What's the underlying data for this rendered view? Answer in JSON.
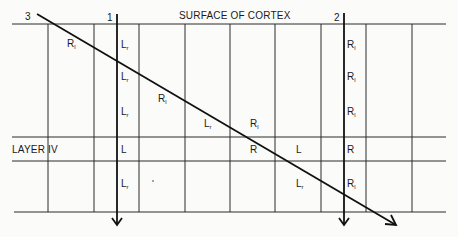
{
  "title": "SURFACE OF CORTEX",
  "layer_label": "LAYER IV",
  "electrodes": [
    {
      "id": "1",
      "label": "1",
      "direction": "vertical"
    },
    {
      "id": "2",
      "label": "2",
      "direction": "vertical"
    },
    {
      "id": "3",
      "label": "3",
      "direction": "oblique"
    }
  ],
  "cell_labels": [
    {
      "base": "R",
      "sub": "l",
      "column": 1,
      "row": "upper-1"
    },
    {
      "base": "L",
      "sub": "r",
      "column": 2,
      "row": "upper-1"
    },
    {
      "base": "L",
      "sub": "r",
      "column": 2,
      "row": "upper-2"
    },
    {
      "base": "R",
      "sub": "l",
      "column": 3,
      "row": "upper-2"
    },
    {
      "base": "L",
      "sub": "r",
      "column": 2,
      "row": "upper-3"
    },
    {
      "base": "L",
      "sub": "r",
      "column": 5,
      "row": "upper-3"
    },
    {
      "base": "R",
      "sub": "l",
      "column": 6,
      "row": "upper-3"
    },
    {
      "base": "R",
      "sub": "l",
      "column": 7,
      "row": "upper-1"
    },
    {
      "base": "R",
      "sub": "l",
      "column": 7,
      "row": "upper-2"
    },
    {
      "base": "R",
      "sub": "l",
      "column": 7,
      "row": "upper-3"
    },
    {
      "base": "L",
      "sub": "",
      "column": 2,
      "row": "layer-iv"
    },
    {
      "base": "R",
      "sub": "",
      "column": 5,
      "row": "layer-iv"
    },
    {
      "base": "L",
      "sub": "",
      "column": 6,
      "row": "layer-iv"
    },
    {
      "base": "R",
      "sub": "",
      "column": 7,
      "row": "layer-iv"
    },
    {
      "base": "L",
      "sub": "r",
      "column": 2,
      "row": "lower"
    },
    {
      "base": "L",
      "sub": "r",
      "column": 6,
      "row": "lower"
    },
    {
      "base": "R",
      "sub": "l",
      "column": 7,
      "row": "lower"
    }
  ]
}
